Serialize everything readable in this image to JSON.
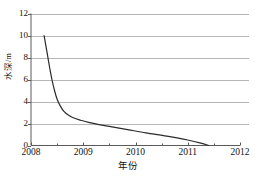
{
  "chart_data": {
    "type": "line",
    "title": "",
    "xlabel": "年份",
    "ylabel": "水深/m",
    "xlim": [
      2008,
      2012
    ],
    "ylim": [
      0,
      12
    ],
    "grid": true,
    "grid_orientation": "horizontal",
    "legend": "none",
    "x_tick_labels": [
      "2008",
      "2009",
      "2010",
      "2011",
      "2012"
    ],
    "x_ticks": [
      2008,
      2009,
      2010,
      2011,
      2012
    ],
    "y_tick_labels": [
      "0",
      "2",
      "4",
      "6",
      "8",
      "10",
      "12"
    ],
    "y_ticks": [
      0,
      2,
      4,
      6,
      8,
      10,
      12
    ],
    "series": [
      {
        "name": "水深",
        "color": "#2b2b2b",
        "x": [
          2008.25,
          2008.28,
          2008.32,
          2008.36,
          2008.4,
          2008.45,
          2008.5,
          2008.56,
          2008.63,
          2008.72,
          2008.82,
          2008.95,
          2009.1,
          2009.3,
          2009.55,
          2009.85,
          2010.2,
          2010.6,
          2011.0,
          2011.25,
          2011.4
        ],
        "y": [
          10.0,
          9.2,
          8.1,
          7.0,
          6.0,
          5.0,
          4.2,
          3.6,
          3.1,
          2.75,
          2.5,
          2.3,
          2.1,
          1.9,
          1.7,
          1.45,
          1.15,
          0.85,
          0.5,
          0.22,
          0.0
        ]
      }
    ],
    "annotations": []
  },
  "axes": {
    "y_title": "水深/m",
    "x_title": "年份"
  },
  "colors": {
    "curve": "#2b2b2b",
    "gridline": "#b5b5b5",
    "axis": "#5a5a5a",
    "text": "#111111",
    "background": "#ffffff"
  }
}
